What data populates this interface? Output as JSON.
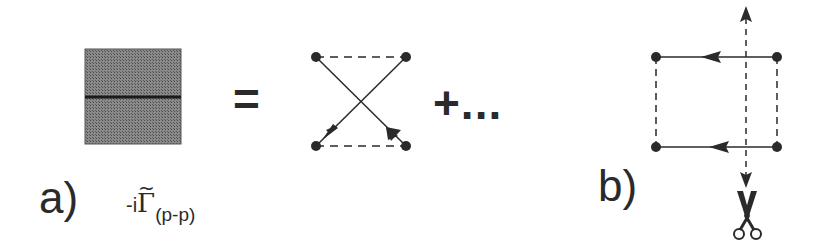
{
  "figure": {
    "panel_a": {
      "label": "a)",
      "vertex_symbol": {
        "prefix": "-i",
        "symbol": "Γ",
        "accent": "~",
        "subscript": "(p-p)"
      },
      "equals": "=",
      "continuation": "+...",
      "shaded_box": {
        "fill": "#6e6e6e",
        "midline": "#1a1a1a"
      },
      "diagram": "crossed ladder with two dashed rungs and two crossing arrowed propagators"
    },
    "panel_b": {
      "label": "b)",
      "diagram": "box diagram with dashed vertical rungs, arrowed horizontal propagators, and a dashed vertical cut line",
      "cut_icon": "scissors"
    },
    "colors": {
      "ink": "#2a2a2a",
      "background": "#ffffff"
    }
  }
}
